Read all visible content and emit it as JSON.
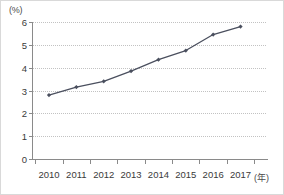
{
  "chart_data": {
    "type": "line",
    "title": "",
    "subtitle": "",
    "xlabel": "(年)",
    "ylabel": "(%)",
    "categories": [
      "2010",
      "2011",
      "2012",
      "2013",
      "2014",
      "2015",
      "2016",
      "2017"
    ],
    "values": [
      2.8,
      3.15,
      3.4,
      3.85,
      4.35,
      4.75,
      5.45,
      5.8
    ],
    "series": [
      {
        "name": "",
        "values": [
          2.8,
          3.15,
          3.4,
          3.85,
          4.35,
          4.75,
          5.45,
          5.8
        ]
      }
    ],
    "ylim": [
      0,
      6
    ],
    "ytick_labels": [
      "0",
      "1",
      "2",
      "3",
      "4",
      "5",
      "6"
    ],
    "ytick_values": [
      0,
      1,
      2,
      3,
      4,
      5,
      6
    ],
    "xtick_labels": [
      "2010",
      "2011",
      "2012",
      "2013",
      "2014",
      "2015",
      "2016",
      "2017"
    ],
    "grid": "horizontal-dotted",
    "legend": "none",
    "marker": "diamond",
    "line_color": "#4a4f5e",
    "grid_color": "#c2c2c2",
    "axis_color": "#8a8a8a",
    "text_color": "#3a3a3a"
  }
}
